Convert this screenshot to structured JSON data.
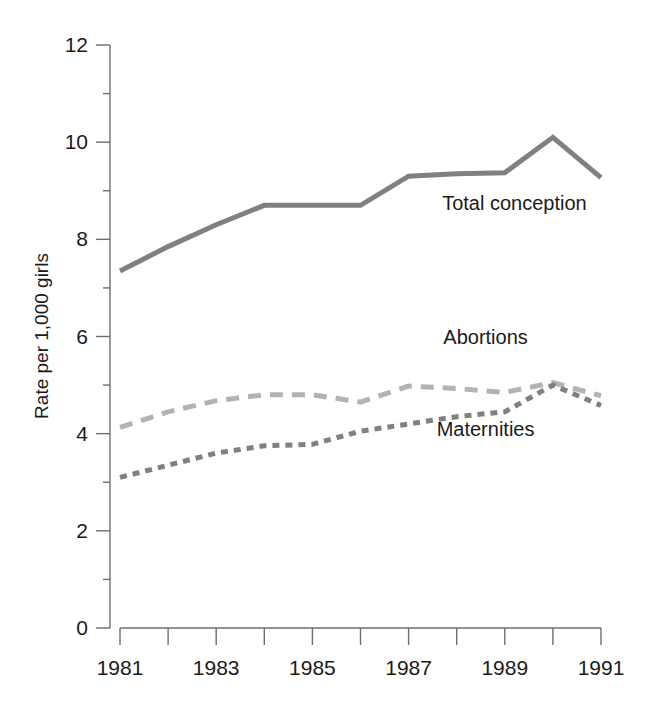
{
  "chart_data": {
    "type": "line",
    "title": "",
    "xlabel": "",
    "ylabel": "Rate per 1,000 girls",
    "xlim": [
      1981,
      1991
    ],
    "ylim": [
      0,
      12
    ],
    "grid": false,
    "legend_position": "inline-annotations",
    "x": [
      1981,
      1982,
      1983,
      1984,
      1985,
      1986,
      1987,
      1988,
      1989,
      1990,
      1991
    ],
    "y_ticks": [
      0,
      2,
      4,
      6,
      8,
      10,
      12
    ],
    "y_tick_labels": [
      "0",
      "2",
      "4",
      "6",
      "8",
      "10",
      "12"
    ],
    "x_ticks": [
      1981,
      1982,
      1983,
      1984,
      1985,
      1986,
      1987,
      1988,
      1989,
      1990,
      1991
    ],
    "x_tick_labels": [
      "1981",
      "",
      "1983",
      "",
      "1985",
      "",
      "1987",
      "",
      "1989",
      "",
      "1991"
    ],
    "series": [
      {
        "name": "Total conception",
        "color": "#808080",
        "style": "solid",
        "width": 5,
        "values": [
          7.35,
          7.85,
          8.3,
          8.7,
          8.7,
          8.7,
          9.3,
          9.35,
          9.37,
          10.1,
          9.27
        ]
      },
      {
        "name": "Abortions",
        "color": "#b3b3b3",
        "style": "dashed",
        "width": 5,
        "values": [
          4.13,
          4.45,
          4.68,
          4.8,
          4.8,
          4.65,
          4.98,
          4.93,
          4.85,
          5.05,
          4.78
        ]
      },
      {
        "name": "Maternities",
        "color": "#808080",
        "style": "dotted",
        "width": 5,
        "values": [
          3.1,
          3.35,
          3.6,
          3.75,
          3.78,
          4.05,
          4.2,
          4.35,
          4.45,
          5.0,
          4.58
        ]
      }
    ],
    "annotations": [
      {
        "text": "Total conception",
        "x": 1989.2,
        "y": 8.6
      },
      {
        "text": "Abortions",
        "x": 1988.6,
        "y": 5.85
      },
      {
        "text": "Maternities",
        "x": 1988.6,
        "y": 3.95
      }
    ]
  }
}
